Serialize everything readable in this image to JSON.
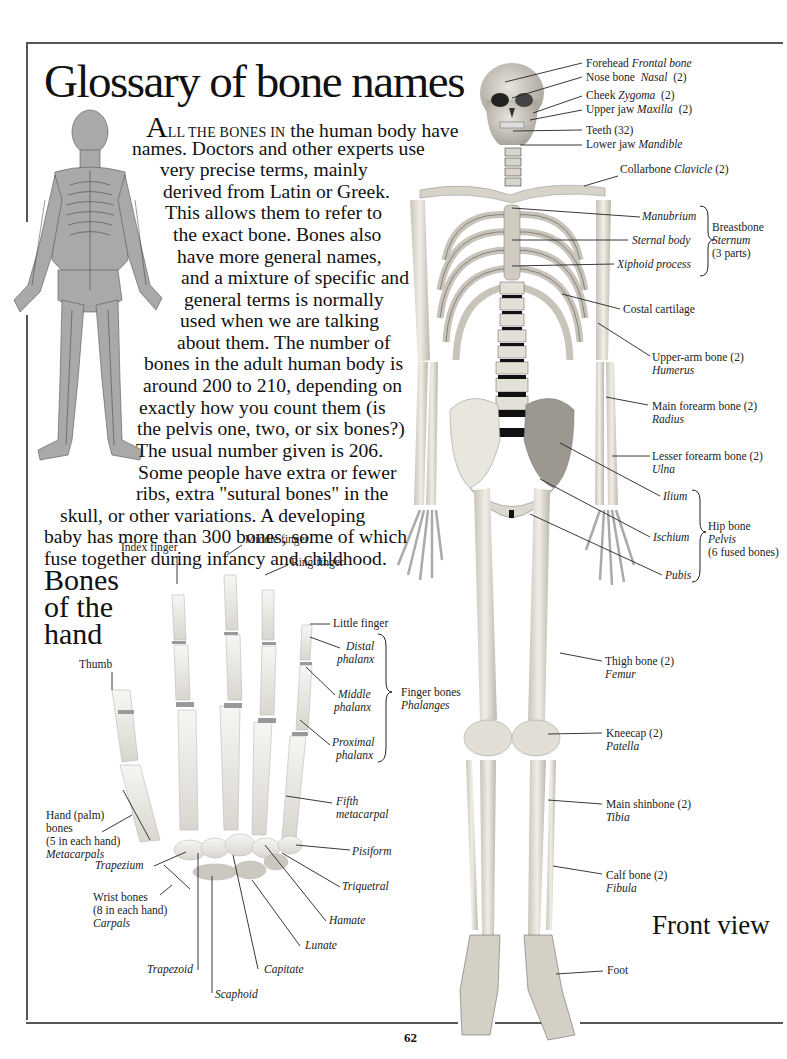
{
  "page": {
    "title": "Glossary of bone names",
    "page_number": "62",
    "intro": {
      "dropcap": "A",
      "smallcaps": "LL THE BONES IN",
      "lines": [
        " the human body have",
        "names. Doctors and other experts use",
        "very precise terms, mainly",
        "derived from Latin or Greek.",
        "This allows them to refer to",
        "the exact bone. Bones also",
        "have more general names,",
        "and a mixture of specific and",
        "general terms is normally",
        "used when we are talking",
        "about them. The number of",
        "bones in the adult human body is",
        "around 200 to 210, depending on",
        "exactly how you count them (is",
        "the pelvis one, two, or six bones?)",
        "The usual number given is 206.",
        "Some people have extra or fewer",
        "ribs, extra \"sutural bones\" in the",
        "skull, or other variations. A developing",
        "baby has more than 300 bones, some of which",
        "fuse together during infancy and childhood."
      ]
    },
    "hand_section": {
      "heading": [
        "Bones",
        "of the",
        "hand"
      ],
      "labels": {
        "index_finger": "Index finger",
        "middle_finger": "Middle finger",
        "ring_finger": "Ring finger",
        "little_finger": "Little finger",
        "thumb": "Thumb",
        "distal": [
          "Distal",
          "phalanx"
        ],
        "middle": [
          "Middle",
          "phalanx"
        ],
        "proximal": [
          "Proximal",
          "phalanx"
        ],
        "finger_bones": "Finger bones",
        "phalanges": "Phalanges",
        "fifth_metacarpal": [
          "Fifth",
          "metacarpal"
        ],
        "palm": [
          "Hand (palm)",
          "bones",
          "(5 in each hand)"
        ],
        "metacarpals": "Metacarpals",
        "trapezium": "Trapezium",
        "wrist": [
          "Wrist bones",
          "(8 in each hand)"
        ],
        "carpals": "Carpals",
        "pisiform": "Pisiform",
        "triquetral": "Triquetral",
        "hamate": "Hamate",
        "lunate": "Lunate",
        "capitate": "Capitate",
        "trapezoid": "Trapezoid",
        "scaphoid": "Scaphoid"
      }
    },
    "skeleton_labels": {
      "forehead": {
        "common": "Forehead",
        "latin": "Frontal bone"
      },
      "nose": {
        "common": "Nose bone",
        "latin": "Nasal",
        "count": "(2)"
      },
      "cheek": {
        "common": "Cheek",
        "latin": "Zygoma",
        "count": "(2)"
      },
      "upper_jaw": {
        "common": "Upper jaw",
        "latin": "Maxilla",
        "count": "(2)"
      },
      "teeth": {
        "common": "Teeth (32)"
      },
      "lower_jaw": {
        "common": "Lower jaw",
        "latin": "Mandible"
      },
      "collarbone": {
        "common": "Collarbone",
        "latin": "Clavicle",
        "count": "(2)"
      },
      "manubrium": "Manubrium",
      "sternal_body": "Sternal body",
      "xiphoid": "Xiphoid process",
      "breastbone": {
        "common": "Breastbone",
        "latin": "Sternum",
        "note": "(3 parts)"
      },
      "costal": "Costal cartilage",
      "upper_arm": {
        "common": "Upper-arm bone (2)",
        "latin": "Humerus"
      },
      "main_forearm": {
        "common": "Main forearm bone (2)",
        "latin": "Radius"
      },
      "lesser_forearm": {
        "common": "Lesser forearm bone (2)",
        "latin": "Ulna"
      },
      "ilium": "Ilium",
      "ischium": "Ischium",
      "pubis": "Pubis",
      "hip": {
        "common": "Hip bone",
        "latin": "Pelvis",
        "note": "(6 fused bones)"
      },
      "thigh": {
        "common": "Thigh bone (2)",
        "latin": "Femur"
      },
      "kneecap": {
        "common": "Kneecap (2)",
        "latin": "Patella"
      },
      "shin": {
        "common": "Main shinbone (2)",
        "latin": "Tibia"
      },
      "calf": {
        "common": "Calf bone (2)",
        "latin": "Fibula"
      },
      "foot": "Foot"
    },
    "view_caption": "Front view",
    "colors": {
      "bone": "#e9e6de",
      "bone_shadow": "#b8b3a8",
      "disc": "#1a1a1a",
      "small_figure": "#a8a8a8",
      "rule": "#555555",
      "text": "#111111"
    }
  }
}
